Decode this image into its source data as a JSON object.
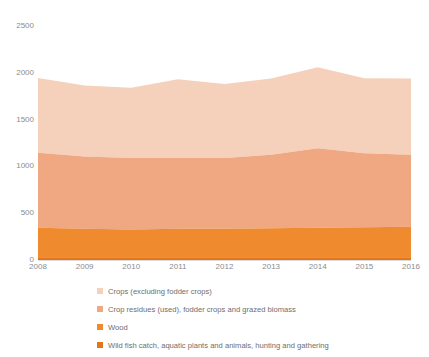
{
  "chart_data": {
    "type": "area",
    "stacked": true,
    "title": "",
    "xlabel": "",
    "ylabel": "",
    "categories": [
      "2008",
      "2009",
      "2010",
      "2011",
      "2012",
      "2013",
      "2014",
      "2015",
      "2016"
    ],
    "x": [
      2008,
      2009,
      2010,
      2011,
      2012,
      2013,
      2014,
      2015,
      2016
    ],
    "ylim": [
      0,
      2500
    ],
    "yticks": [
      0,
      500,
      1000,
      1500,
      2000,
      2500
    ],
    "ytick_labels": [
      "0",
      "500",
      "1000",
      "1500",
      "2000",
      "2500"
    ],
    "grid": false,
    "legend_position": "bottom",
    "series": [
      {
        "name": "Wild fish catch, aquatic plants and animals, hunting and gathering",
        "color": "#E2761B",
        "values": [
          30,
          30,
          29,
          29,
          29,
          29,
          29,
          30,
          30
        ]
      },
      {
        "name": "Wood",
        "color": "#F08A2E",
        "values": [
          315,
          305,
          296,
          306,
          306,
          311,
          316,
          321,
          325
        ]
      },
      {
        "name": "Crop residues (used), fodder crops and grazed biomass",
        "color": "#F0A882",
        "values": [
          800,
          770,
          765,
          755,
          755,
          785,
          850,
          790,
          770
        ]
      },
      {
        "name": "Crops (excluding fodder crops)",
        "color": "#F5D0BB",
        "values": [
          800,
          760,
          750,
          840,
          790,
          815,
          865,
          800,
          815
        ]
      }
    ],
    "stack_tops": {
      "wild_fish": [
        30,
        30,
        29,
        29,
        29,
        29,
        29,
        30,
        30
      ],
      "wood": [
        345,
        335,
        325,
        335,
        335,
        340,
        345,
        351,
        355
      ],
      "crop_residues": [
        1145,
        1105,
        1090,
        1090,
        1090,
        1125,
        1195,
        1141,
        1125
      ],
      "total": [
        1945,
        1865,
        1840,
        1930,
        1880,
        1940,
        2060,
        1941,
        1940
      ]
    }
  },
  "axes": {
    "y_ticks": [
      {
        "label": "2500",
        "value": 2500
      },
      {
        "label": "2000",
        "value": 2000
      },
      {
        "label": "1500",
        "value": 1500
      },
      {
        "label": "1000",
        "value": 1000
      },
      {
        "label": "500",
        "value": 500
      },
      {
        "label": "0",
        "value": 0
      }
    ],
    "x_ticks": [
      {
        "label": "2008"
      },
      {
        "label": "2009"
      },
      {
        "label": "2010"
      },
      {
        "label": "2011"
      },
      {
        "label": "2012"
      },
      {
        "label": "2013"
      },
      {
        "label": "2014"
      },
      {
        "label": "2015"
      },
      {
        "label": "2016"
      }
    ]
  },
  "legend": {
    "items": [
      {
        "label": "Crops (excluding fodder crops)",
        "color": "#F5D0BB"
      },
      {
        "label": "Crop residues (used), fodder crops and grazed biomass",
        "color": "#F0A882"
      },
      {
        "label": "Wood",
        "color": "#F08A2E"
      },
      {
        "label": "Wild fish catch, aquatic plants and animals, hunting and gathering",
        "color": "#E2761B"
      }
    ]
  },
  "colors": {
    "axis_text": "#8c8c8c",
    "axis_line": "#d9d9d9",
    "background": "#ffffff"
  }
}
